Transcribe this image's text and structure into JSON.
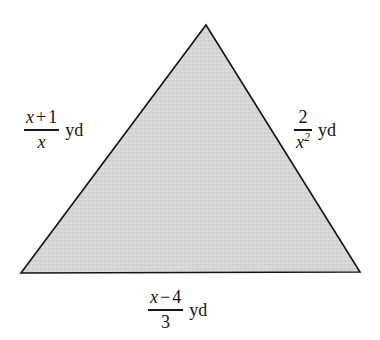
{
  "figure": {
    "type": "geometry-diagram",
    "shape": "triangle",
    "background_color": "#ffffff",
    "fill_color": "#d5d5d5",
    "stroke_color": "#141414",
    "stroke_width": 1.6,
    "unit": "yd",
    "vertices": {
      "apex": {
        "x": 206,
        "y": 25
      },
      "bottom_left": {
        "x": 21,
        "y": 273
      },
      "bottom_right": {
        "x": 360,
        "y": 272
      }
    }
  },
  "labels": {
    "left": {
      "side": "left-side",
      "numerator_var": "x",
      "numerator_op": "+",
      "numerator_const": "1",
      "denominator": "x",
      "unit": "yd",
      "expression": "(x + 1)/x yd"
    },
    "right": {
      "side": "right-side",
      "numerator": "2",
      "denominator_var": "x",
      "denominator_exponent": "2",
      "unit": "yd",
      "expression": "2/x^2 yd"
    },
    "bottom": {
      "side": "base",
      "numerator_var": "x",
      "numerator_op": "−",
      "numerator_const": "4",
      "denominator": "3",
      "unit": "yd",
      "expression": "(x - 4)/3 yd"
    }
  }
}
